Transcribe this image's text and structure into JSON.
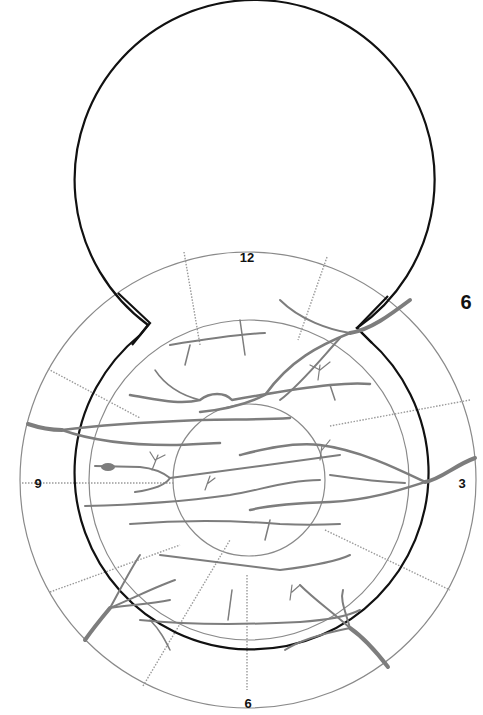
{
  "figure": {
    "panel_label": "6",
    "clock_labels": {
      "top": "12",
      "right": "3",
      "bottom": "6",
      "left": "9"
    }
  },
  "diagram": {
    "type": "retinal fundus drawing chart",
    "colors": {
      "outline": "#111111",
      "rings": "#8a8a8a",
      "meridians": "#9a9a9a",
      "vessels": "#7d7d7d"
    }
  }
}
